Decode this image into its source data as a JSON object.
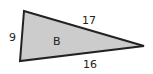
{
  "diagram": {
    "type": "triangle",
    "shape_label": "B",
    "fill_color": "#cccccc",
    "stroke_color": "#222222",
    "sides": {
      "left": "9",
      "top": "17",
      "bottom": "16"
    }
  }
}
